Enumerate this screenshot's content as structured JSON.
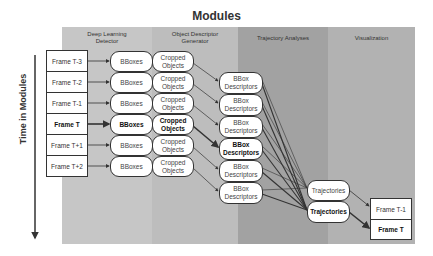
{
  "title": "Modules",
  "time_axis": {
    "label": "Time in Modules"
  },
  "columns": [
    {
      "label_line1": "Deep Learning",
      "label_line2": "Detector"
    },
    {
      "label_line1": "Object Descriptor",
      "label_line2": "Generator"
    },
    {
      "label_line1": "Trajectory Analyses",
      "label_line2": ""
    },
    {
      "label_line1": "Visualization",
      "label_line2": ""
    }
  ],
  "input_frames": [
    "Frame T-3",
    "Frame T-2",
    "Frame T-1",
    "Frame T",
    "Frame T+1",
    "Frame T+2"
  ],
  "bboxes": [
    "BBoxes",
    "BBoxes",
    "BBoxes",
    "BBoxes",
    "BBoxes",
    "BBoxes"
  ],
  "cropped": [
    {
      "l1": "Cropped",
      "l2": "Objects"
    },
    {
      "l1": "Cropped",
      "l2": "Objects"
    },
    {
      "l1": "Cropped",
      "l2": "Objects"
    },
    {
      "l1": "Cropped",
      "l2": "Objects"
    },
    {
      "l1": "Cropped",
      "l2": "Objects"
    },
    {
      "l1": "Cropped",
      "l2": "Objects"
    }
  ],
  "descriptors": [
    {
      "l1": "BBox",
      "l2": "Descriptors"
    },
    {
      "l1": "BBox",
      "l2": "Descriptors"
    },
    {
      "l1": "BBox",
      "l2": "Descriptors"
    },
    {
      "l1": "BBox",
      "l2": "Descriptors"
    },
    {
      "l1": "BBox",
      "l2": "Descriptors"
    },
    {
      "l1": "BBox",
      "l2": "Descriptors"
    }
  ],
  "trajectories": [
    "Trajectories",
    "Trajectories"
  ],
  "output_frames": [
    "Frame T-1",
    "Frame T"
  ],
  "highlight_index": 3,
  "colors": {
    "detector_bg": "#c6c6c6",
    "descriptor_bg": "#bdbdbd",
    "trajectory_bg": "#a2a2a2",
    "visualization_bg": "#b2b2b2",
    "line": "#333333"
  }
}
